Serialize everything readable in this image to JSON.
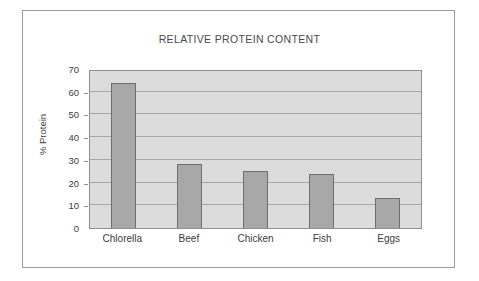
{
  "chart_data": {
    "type": "bar",
    "title": "RELATIVE PROTEIN CONTENT",
    "xlabel": "",
    "ylabel": "% Protein",
    "categories": [
      "Chlorella",
      "Beef",
      "Chicken",
      "Fish",
      "Eggs"
    ],
    "values": [
      64,
      28,
      25,
      24,
      13
    ],
    "ylim": [
      0,
      70
    ],
    "ytick_step": 10,
    "yticks": [
      0,
      10,
      20,
      30,
      40,
      50,
      60,
      70
    ],
    "ytick_labels": [
      "0",
      "10",
      "20",
      "30",
      "40",
      "50",
      "60",
      "70"
    ],
    "grid": true,
    "grid_axis": "y",
    "legend": false,
    "legend_position": "none",
    "series": [
      {
        "name": "% Protein",
        "values": [
          64,
          28,
          25,
          24,
          13
        ]
      }
    ],
    "colors": {
      "bar_fill": "#a8a8a8",
      "bar_border": "#6e6e6e",
      "plot_background": "#dcdcdc",
      "plot_border": "#8f8f8f",
      "gridline": "#a6a6a6",
      "frame_border": "#9a9a9a",
      "page_background": "#ffffff",
      "title_color": "#4a4a4a",
      "axis_text": "#3c3c3c"
    }
  }
}
